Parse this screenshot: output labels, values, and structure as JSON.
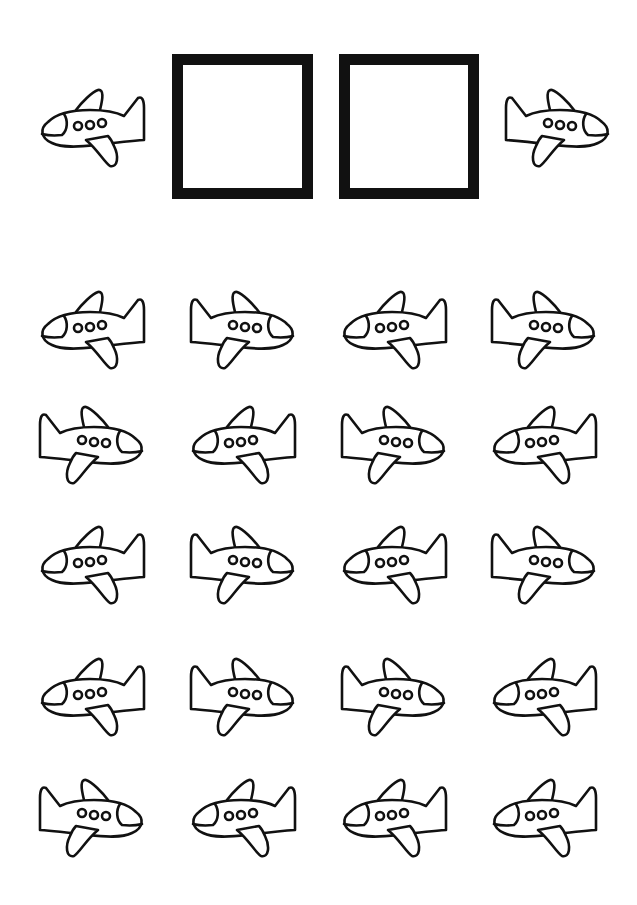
{
  "worksheet": {
    "description": "Count the airplanes worksheet",
    "colors": {
      "ink": "#111111",
      "paper": "#ffffff"
    },
    "header": {
      "left_plane": {
        "direction": "left",
        "x": 38,
        "y": 88
      },
      "right_plane": {
        "direction": "right",
        "x": 504,
        "y": 88
      },
      "answer_boxes": [
        {
          "x": 172,
          "y": 54,
          "w": 141,
          "h": 145,
          "value": ""
        },
        {
          "x": 339,
          "y": 54,
          "w": 140,
          "h": 145,
          "value": ""
        }
      ]
    },
    "grid": {
      "columns_x": [
        38,
        189,
        340,
        490
      ],
      "rows_y": [
        290,
        405,
        525,
        657,
        778
      ],
      "rows": [
        [
          "left",
          "right",
          "left",
          "right"
        ],
        [
          "right",
          "left",
          "right",
          "left"
        ],
        [
          "left",
          "right",
          "left",
          "right"
        ],
        [
          "left",
          "right",
          "right",
          "left"
        ],
        [
          "right",
          "left",
          "left",
          "left"
        ]
      ]
    },
    "icons": {
      "plane": "airplane-icon"
    }
  }
}
